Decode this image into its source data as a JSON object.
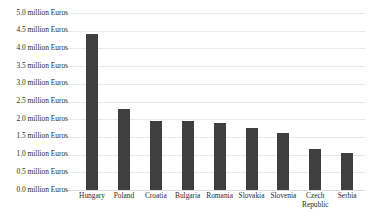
{
  "chart_data": {
    "type": "bar",
    "title": "",
    "subtitle": "",
    "xlabel": "",
    "ylabel": "",
    "grid": true,
    "legend": "none",
    "unit_suffix": "million Euros",
    "categories": [
      "Hungary",
      "Poland",
      "Croatia",
      "Bulgaria",
      "Romania",
      "Slovakia",
      "Slovenia",
      "Czech Republic",
      "Serbia"
    ],
    "category_lines": [
      [
        "Hungary"
      ],
      [
        "Poland"
      ],
      [
        "Croatia"
      ],
      [
        "Bulgaria"
      ],
      [
        "Romania"
      ],
      [
        "Slovakia"
      ],
      [
        "Slovenia"
      ],
      [
        "Czech",
        "Republic"
      ],
      [
        "Serbia"
      ]
    ],
    "values": [
      4.4,
      2.3,
      1.95,
      1.95,
      1.9,
      1.75,
      1.6,
      1.15,
      1.05
    ],
    "ylim": [
      0.0,
      5.0
    ],
    "ytick_values": [
      5.0,
      4.5,
      4.0,
      3.5,
      3.0,
      2.5,
      2.0,
      1.5,
      1.0,
      0.5,
      0.0
    ],
    "ytick_labels": [
      "5.0 million Euros",
      "4.5 million Euros",
      "4.0 million Euros",
      "3.5 million Euros",
      "3.0 million Euros",
      "2.5 million Euros",
      "2.0 million Euros",
      "1.5 million Euros",
      "1.0 million Euros",
      "0.5 million Euros",
      "0.0 million Euros"
    ],
    "bar_color": "#3f3f3f",
    "gridline_color": "#e9e9e9",
    "background_color": "#ffffff",
    "text_color": "#2b2b2b"
  }
}
